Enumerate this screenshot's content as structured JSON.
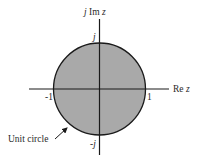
{
  "figure": {
    "type": "complex-plane-unit-circle",
    "region_fill": "#a9a9a9",
    "stroke_color": "#1a1a1a",
    "axes": {
      "vertical": {
        "label_prefix": "j",
        "label_main": " Im ",
        "label_var": "z"
      },
      "horizontal": {
        "label_main": "Re ",
        "label_var": "z"
      }
    },
    "ticks": {
      "positive_real": "1",
      "negative_real": "-1",
      "positive_imag": "j",
      "negative_imag": "-j"
    },
    "annotation": {
      "text": "Unit circle"
    }
  }
}
